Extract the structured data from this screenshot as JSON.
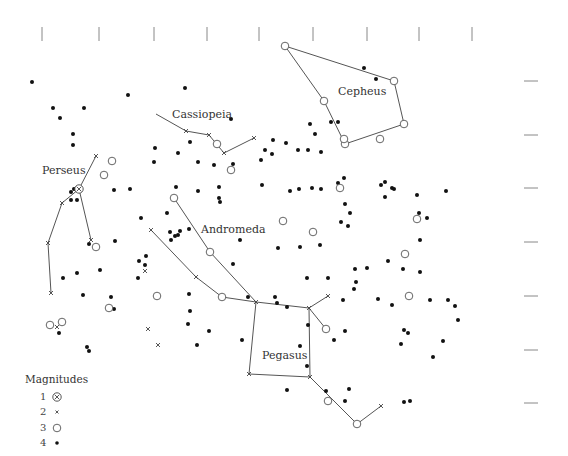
{
  "chart_data": {
    "type": "scatter",
    "title": "",
    "grid": false,
    "top_ticks_x": [
      42,
      99,
      154,
      207,
      259,
      313,
      367,
      419,
      472
    ],
    "right_ticks_y": [
      81,
      135,
      188,
      242,
      296,
      350,
      403
    ],
    "constellation_labels": [
      {
        "name": "Cassiopeia",
        "x": 172,
        "y": 115
      },
      {
        "name": "Cepheus",
        "x": 338,
        "y": 95
      },
      {
        "name": "Perseus",
        "x": 42,
        "y": 174
      },
      {
        "name": "Andromeda",
        "x": 201,
        "y": 233
      },
      {
        "name": "Pegasus",
        "x": 262,
        "y": 359
      }
    ],
    "legend": {
      "title": "Magnitudes",
      "entries": [
        {
          "magnitude": "1",
          "symbol": "circled-x"
        },
        {
          "magnitude": "2",
          "symbol": "x"
        },
        {
          "magnitude": "3",
          "symbol": "open-circle"
        },
        {
          "magnitude": "4",
          "symbol": "dot"
        }
      ]
    },
    "lines": [
      {
        "constellation": "Cepheus",
        "points": [
          [
            285,
            46
          ],
          [
            394,
            81
          ],
          [
            404,
            124
          ],
          [
            345,
            144
          ],
          [
            324,
            101
          ],
          [
            285,
            46
          ]
        ]
      },
      {
        "constellation": "Cassiopeia",
        "points": [
          [
            156,
            114
          ],
          [
            186,
            131
          ],
          [
            209,
            135
          ],
          [
            224,
            153
          ],
          [
            254,
            138
          ]
        ]
      },
      {
        "constellation": "Perseus",
        "points": [
          [
            96,
            156
          ],
          [
            79,
            189
          ],
          [
            62,
            203
          ],
          [
            48,
            243
          ],
          [
            51,
            293
          ]
        ]
      },
      {
        "constellation": "Perseus",
        "points": [
          [
            79,
            189
          ],
          [
            91,
            240
          ]
        ]
      },
      {
        "constellation": "Andromeda",
        "points": [
          [
            174,
            198
          ],
          [
            210,
            252
          ],
          [
            256,
            302
          ]
        ]
      },
      {
        "constellation": "Andromeda",
        "points": [
          [
            151,
            230
          ],
          [
            196,
            277
          ],
          [
            222,
            297
          ],
          [
            256,
            302
          ]
        ]
      },
      {
        "constellation": "Pegasus",
        "points": [
          [
            256,
            302
          ],
          [
            309,
            308
          ],
          [
            310,
            377
          ],
          [
            249,
            374
          ],
          [
            256,
            302
          ]
        ]
      },
      {
        "constellation": "Pegasus",
        "points": [
          [
            309,
            308
          ],
          [
            328,
            296
          ]
        ]
      },
      {
        "constellation": "Pegasus",
        "points": [
          [
            309,
            308
          ],
          [
            326,
            329
          ]
        ]
      },
      {
        "constellation": "Pegasus",
        "points": [
          [
            310,
            377
          ],
          [
            357,
            424
          ],
          [
            381,
            406
          ]
        ]
      }
    ],
    "stars": {
      "mag1": [
        [
          79,
          189
        ]
      ],
      "mag2": [
        [
          96,
          156
        ],
        [
          62,
          203
        ],
        [
          48,
          243
        ],
        [
          51,
          293
        ],
        [
          91,
          240
        ],
        [
          186,
          131
        ],
        [
          209,
          135
        ],
        [
          224,
          153
        ],
        [
          254,
          138
        ],
        [
          151,
          230
        ],
        [
          196,
          277
        ],
        [
          256,
          302
        ],
        [
          309,
          308
        ],
        [
          328,
          296
        ],
        [
          249,
          374
        ],
        [
          310,
          377
        ],
        [
          381,
          406
        ],
        [
          145,
          271
        ],
        [
          57,
          327
        ],
        [
          148,
          329
        ],
        [
          158,
          345
        ]
      ],
      "mag3": [
        [
          285,
          46
        ],
        [
          394,
          81
        ],
        [
          324,
          101
        ],
        [
          345,
          144
        ],
        [
          404,
          124
        ],
        [
          380,
          139
        ],
        [
          344,
          139
        ],
        [
          217,
          144
        ],
        [
          231,
          170
        ],
        [
          112,
          161
        ],
        [
          104,
          175
        ],
        [
          174,
          198
        ],
        [
          210,
          252
        ],
        [
          222,
          297
        ],
        [
          96,
          247
        ],
        [
          109,
          308
        ],
        [
          157,
          296
        ],
        [
          50,
          325
        ],
        [
          62,
          322
        ],
        [
          283,
          221
        ],
        [
          313,
          232
        ],
        [
          340,
          188
        ],
        [
          417,
          219
        ],
        [
          405,
          254
        ],
        [
          409,
          296
        ],
        [
          326,
          329
        ],
        [
          328,
          401
        ],
        [
          357,
          424
        ]
      ],
      "mag4": [
        [
          32,
          82
        ],
        [
          128,
          95
        ],
        [
          185,
          88
        ],
        [
          53,
          108
        ],
        [
          84,
          108
        ],
        [
          60,
          118
        ],
        [
          73,
          134
        ],
        [
          73,
          145
        ],
        [
          231,
          119
        ],
        [
          155,
          148
        ],
        [
          178,
          153
        ],
        [
          190,
          142
        ],
        [
          273,
          140
        ],
        [
          265,
          150
        ],
        [
          261,
          160
        ],
        [
          286,
          143
        ],
        [
          315,
          134
        ],
        [
          331,
          122
        ],
        [
          308,
          150
        ],
        [
          321,
          152
        ],
        [
          338,
          122
        ],
        [
          376,
          79
        ],
        [
          364,
          68
        ],
        [
          298,
          150
        ],
        [
          310,
          124
        ],
        [
          214,
          165
        ],
        [
          233,
          164
        ],
        [
          272,
          154
        ],
        [
          154,
          162
        ],
        [
          198,
          162
        ],
        [
          176,
          187
        ],
        [
          198,
          191
        ],
        [
          219,
          187
        ],
        [
          219,
          198
        ],
        [
          220,
          202
        ],
        [
          262,
          185
        ],
        [
          74,
          189
        ],
        [
          71,
          192
        ],
        [
          71,
          200
        ],
        [
          77,
          200
        ],
        [
          114,
          190
        ],
        [
          130,
          189
        ],
        [
          141,
          218
        ],
        [
          167,
          213
        ],
        [
          175,
          236
        ],
        [
          171,
          240
        ],
        [
          178,
          235
        ],
        [
          189,
          229
        ],
        [
          290,
          191
        ],
        [
          299,
          189
        ],
        [
          312,
          188
        ],
        [
          321,
          189
        ],
        [
          338,
          183
        ],
        [
          344,
          178
        ],
        [
          381,
          185
        ],
        [
          385,
          182
        ],
        [
          392,
          188
        ],
        [
          446,
          191
        ],
        [
          385,
          197
        ],
        [
          345,
          204
        ],
        [
          350,
          213
        ],
        [
          320,
          245
        ],
        [
          341,
          222
        ],
        [
          348,
          226
        ],
        [
          394,
          189
        ],
        [
          417,
          195
        ],
        [
          419,
          213
        ],
        [
          427,
          218
        ],
        [
          420,
          240
        ],
        [
          420,
          272
        ],
        [
          430,
          300
        ],
        [
          448,
          300
        ],
        [
          455,
          306
        ],
        [
          458,
          320
        ],
        [
          443,
          341
        ],
        [
          433,
          357
        ],
        [
          401,
          344
        ],
        [
          404,
          330
        ],
        [
          367,
          268
        ],
        [
          355,
          269
        ],
        [
          356,
          282
        ],
        [
          388,
          261
        ],
        [
          403,
          269
        ],
        [
          328,
          278
        ],
        [
          354,
          289
        ],
        [
          343,
          300
        ],
        [
          378,
          299
        ],
        [
          392,
          305
        ],
        [
          408,
          333
        ],
        [
          345,
          331
        ],
        [
          334,
          340
        ],
        [
          308,
          325
        ],
        [
          287,
          307
        ],
        [
          307,
          278
        ],
        [
          233,
          264
        ],
        [
          240,
          240
        ],
        [
          278,
          248
        ],
        [
          300,
          247
        ],
        [
          248,
          297
        ],
        [
          275,
          297
        ],
        [
          277,
          303
        ],
        [
          242,
          340
        ],
        [
          300,
          346
        ],
        [
          307,
          366
        ],
        [
          287,
          390
        ],
        [
          349,
          389
        ],
        [
          326,
          391
        ],
        [
          345,
          401
        ],
        [
          404,
          402
        ],
        [
          410,
          401
        ],
        [
          63,
          278
        ],
        [
          77,
          273
        ],
        [
          100,
          270
        ],
        [
          83,
          295
        ],
        [
          111,
          297
        ],
        [
          114,
          309
        ],
        [
          139,
          261
        ],
        [
          145,
          265
        ],
        [
          138,
          278
        ],
        [
          189,
          294
        ],
        [
          190,
          311
        ],
        [
          188,
          324
        ],
        [
          209,
          331
        ],
        [
          197,
          345
        ],
        [
          146,
          256
        ],
        [
          115,
          241
        ],
        [
          89,
          244
        ],
        [
          87,
          347
        ],
        [
          89,
          351
        ],
        [
          59,
          333
        ],
        [
          170,
          232
        ],
        [
          180,
          231
        ]
      ]
    }
  },
  "legend": {
    "title": "Magnitudes",
    "items": [
      {
        "num": "1"
      },
      {
        "num": "2"
      },
      {
        "num": "3"
      },
      {
        "num": "4"
      }
    ]
  },
  "labels": {
    "cassiopeia": "Cassiopeia",
    "cepheus": "Cepheus",
    "perseus": "Perseus",
    "andromeda": "Andromeda",
    "pegasus": "Pegasus"
  }
}
